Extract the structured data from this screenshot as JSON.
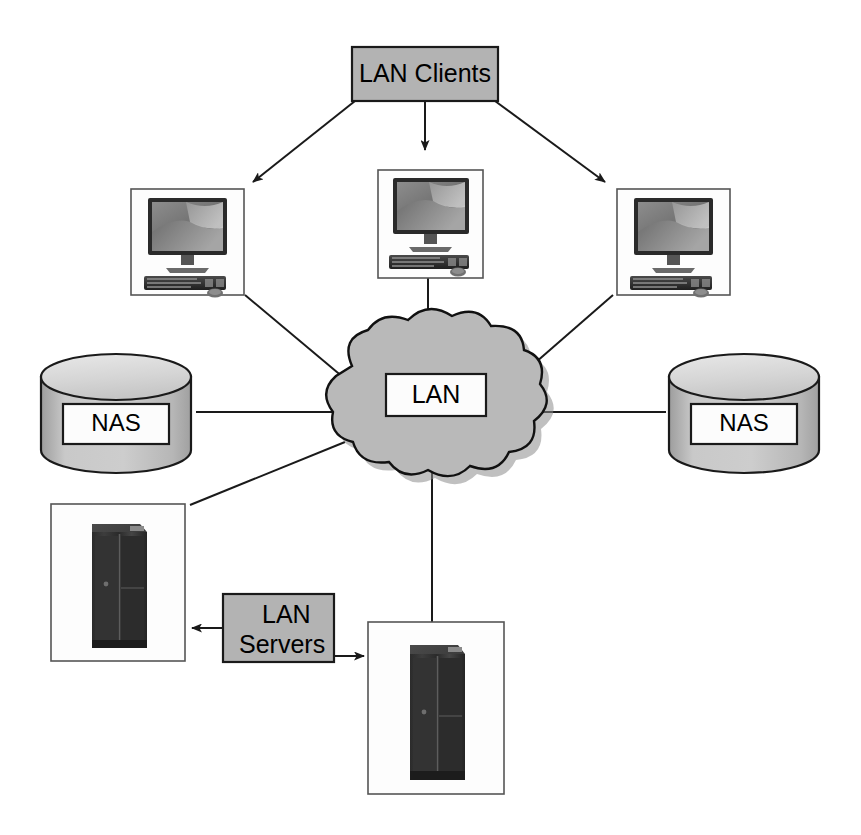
{
  "diagram": {
    "background_color": "#ffffff",
    "line_color": "#1a1a1a",
    "gray_fill": "#b3b3b3",
    "cloud_fill": "#b9b9b9",
    "nodes": {
      "lan_clients_label": "LAN Clients",
      "lan_cloud_label": "LAN",
      "nas_left_label": "NAS",
      "nas_right_label": "NAS",
      "lan_servers_label_line1": "LAN",
      "lan_servers_label_line2": "Servers"
    },
    "icons": {
      "workstation_left": "desktop-computer-icon",
      "workstation_center": "desktop-computer-icon",
      "workstation_right": "desktop-computer-icon",
      "server_left": "server-rack-icon",
      "server_bottom": "server-rack-icon",
      "nas_left": "storage-cylinder-icon",
      "nas_right": "storage-cylinder-icon",
      "cloud": "network-cloud-icon"
    },
    "connections": [
      {
        "from": "lan-clients",
        "to": "workstation-left",
        "style": "arrow"
      },
      {
        "from": "lan-clients",
        "to": "workstation-center",
        "style": "arrow"
      },
      {
        "from": "lan-clients",
        "to": "workstation-right",
        "style": "arrow"
      },
      {
        "from": "workstation-left",
        "to": "lan-cloud",
        "style": "plain"
      },
      {
        "from": "workstation-center",
        "to": "lan-cloud",
        "style": "plain"
      },
      {
        "from": "workstation-right",
        "to": "lan-cloud",
        "style": "plain"
      },
      {
        "from": "nas-left",
        "to": "lan-cloud",
        "style": "plain"
      },
      {
        "from": "nas-right",
        "to": "lan-cloud",
        "style": "plain"
      },
      {
        "from": "lan-cloud",
        "to": "server-left",
        "style": "plain"
      },
      {
        "from": "lan-cloud",
        "to": "server-bottom",
        "style": "plain"
      },
      {
        "from": "lan-servers",
        "to": "server-left",
        "style": "arrow"
      },
      {
        "from": "lan-servers",
        "to": "server-bottom",
        "style": "arrow"
      }
    ]
  }
}
